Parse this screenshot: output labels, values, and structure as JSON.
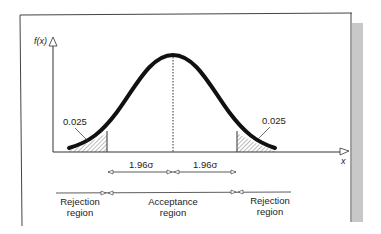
{
  "figure": {
    "type": "normal-distribution-two-tailed-test",
    "y_axis_label": "f(x)",
    "x_axis_label": "x",
    "tail_area_left": "0.025",
    "tail_area_right": "0.025",
    "sigma_left_label": "1.96σ",
    "sigma_right_label": "1.96σ",
    "regions": {
      "left": [
        "Rejection",
        "region"
      ],
      "center": [
        "Acceptance",
        "region"
      ],
      "right": [
        "Rejection",
        "region"
      ]
    },
    "colors": {
      "curve": "#111111",
      "axes": "#333333",
      "frame": "#444444",
      "shadow": "#c8c8c8",
      "hatch": "#555555"
    }
  }
}
